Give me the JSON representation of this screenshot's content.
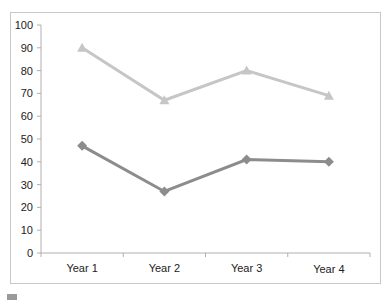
{
  "chart_data": {
    "type": "line",
    "title": "",
    "xlabel": "",
    "ylabel": "",
    "categories": [
      "Year 1",
      "Year 2",
      "Year 3",
      "Year 4"
    ],
    "series": [
      {
        "name": "Series A",
        "marker": "triangle",
        "color": "#c6c6c6",
        "values": [
          90,
          67,
          80,
          69
        ]
      },
      {
        "name": "Series B",
        "marker": "diamond",
        "color": "#8c8c8c",
        "values": [
          47,
          27,
          41,
          40
        ]
      }
    ],
    "ylim": [
      0,
      100
    ],
    "yticks": [
      0,
      10,
      20,
      30,
      40,
      50,
      60,
      70,
      80,
      90,
      100
    ],
    "grid": false,
    "legend_position": "bottom (cropped)"
  },
  "axis": {
    "y_tick_labels": [
      "0",
      "10",
      "20",
      "30",
      "40",
      "50",
      "60",
      "70",
      "80",
      "90",
      "100"
    ],
    "x_tick_labels": [
      "Year 1",
      "Year 2",
      "Year 3",
      "Year 4"
    ]
  },
  "colors": {
    "axis": "#b0b0b0",
    "frame": "#c8c8c8",
    "series_a": "#c6c6c6",
    "series_b": "#8c8c8c"
  }
}
